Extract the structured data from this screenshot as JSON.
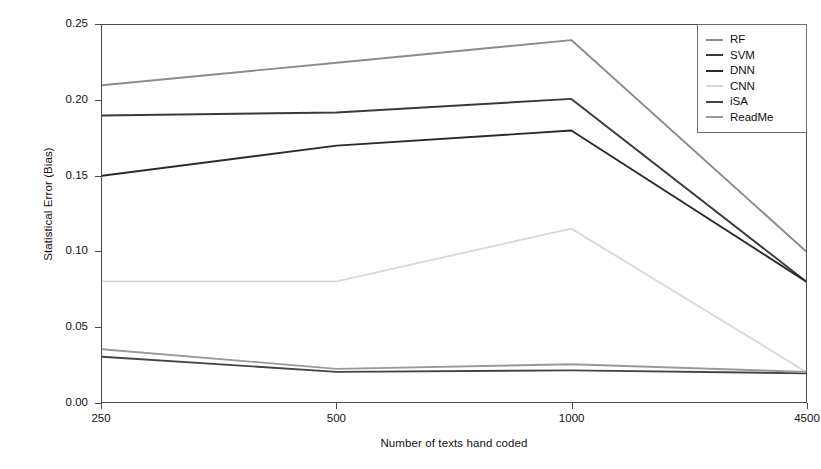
{
  "chart_data": {
    "type": "line",
    "title": "",
    "xlabel": "Number of texts hand coded",
    "ylabel": "Statistical Error (Bias)",
    "categories": [
      "250",
      "500",
      "1000",
      "4500"
    ],
    "xtick_labels": [
      "250",
      "500",
      "1000",
      "4500"
    ],
    "ytick_labels": [
      "0.00",
      "0.05",
      "0.10",
      "0.15",
      "0.20",
      "0.25"
    ],
    "ytick_values": [
      0.0,
      0.05,
      0.1,
      0.15,
      0.2,
      0.25
    ],
    "ylim": [
      0.0,
      0.25
    ],
    "grid": false,
    "legend_position": "top-right",
    "series": [
      {
        "name": "RF",
        "values": [
          0.21,
          0.225,
          0.24,
          0.1
        ],
        "color": "#8c8c8c"
      },
      {
        "name": "SVM",
        "values": [
          0.19,
          0.192,
          0.201,
          0.08
        ],
        "color": "#3a3a3a"
      },
      {
        "name": "DNN",
        "values": [
          0.15,
          0.17,
          0.18,
          0.08
        ],
        "color": "#2b2b2b"
      },
      {
        "name": "CNN",
        "values": [
          0.08,
          0.08,
          0.115,
          0.02
        ],
        "color": "#d9d9d9"
      },
      {
        "name": "iSA",
        "values": [
          0.03,
          0.02,
          0.021,
          0.019
        ],
        "color": "#454545"
      },
      {
        "name": "ReadMe",
        "values": [
          0.035,
          0.022,
          0.025,
          0.02
        ],
        "color": "#9a9a9a"
      }
    ]
  },
  "legend": {
    "items": [
      {
        "label": "RF"
      },
      {
        "label": "SVM"
      },
      {
        "label": "DNN"
      },
      {
        "label": "CNN"
      },
      {
        "label": "iSA"
      },
      {
        "label": "ReadMe"
      }
    ]
  }
}
